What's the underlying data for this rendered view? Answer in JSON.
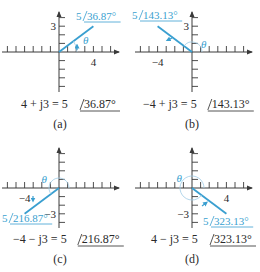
{
  "panels": [
    {
      "id": "a",
      "label": "(a)",
      "equation_lhs": "4 + j3 = 5",
      "angle_text": "36.87°",
      "vector_label_mag": "5",
      "vector_label_angle": "36.87°",
      "real": 4,
      "imag": 3,
      "x_tick_label": "4",
      "y_tick_label": "3",
      "theta": "θ"
    },
    {
      "id": "b",
      "label": "(b)",
      "equation_lhs": "−4 + j3 = 5",
      "angle_text": "143.13°",
      "vector_label_mag": "5",
      "vector_label_angle": "143.13°",
      "real": -4,
      "imag": 3,
      "x_tick_label": "−4",
      "y_tick_label": "3",
      "theta": "θ"
    },
    {
      "id": "c",
      "label": "(c)",
      "equation_lhs": "−4 − j3 = 5",
      "angle_text": "216.87°",
      "vector_label_mag": "5",
      "vector_label_angle": "216.87°",
      "real": -4,
      "imag": -3,
      "x_tick_label": "−4",
      "y_tick_label": "−3",
      "theta": "θ"
    },
    {
      "id": "d",
      "label": "(d)",
      "equation_lhs": "4 − j3 = 5",
      "angle_text": "323.13°",
      "vector_label_mag": "5",
      "vector_label_angle": "323.13°",
      "real": 4,
      "imag": -3,
      "x_tick_label": "4",
      "y_tick_label": "−3",
      "theta": "θ"
    }
  ],
  "colors": {
    "vector": "#3a9fd0",
    "arc": "#9fcbe6",
    "axis": "#3a3a3a",
    "text": "#2a2a2a"
  }
}
